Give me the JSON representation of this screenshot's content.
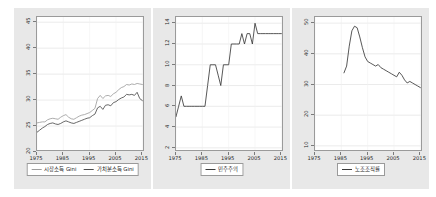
{
  "figure": {
    "background": "#ffffff",
    "panel_background": "#e8e8e8",
    "plot_background": "#ffffff",
    "grid": "on"
  },
  "chart_data": [
    {
      "type": "line",
      "title": "",
      "xlabel": "",
      "ylabel": "",
      "xlim": [
        1975,
        2016
      ],
      "ylim": [
        20,
        46
      ],
      "xticks": [
        1975,
        1985,
        1995,
        2005,
        2015
      ],
      "yticks": [
        20,
        25,
        30,
        35,
        40,
        45
      ],
      "grid": "on",
      "legend_position": "below",
      "series": [
        {
          "name": "시장소득 Gini",
          "color": "#9e9e9e",
          "x": [
            1975,
            1976,
            1977,
            1978,
            1979,
            1980,
            1981,
            1982,
            1983,
            1984,
            1985,
            1986,
            1987,
            1988,
            1989,
            1990,
            1991,
            1992,
            1993,
            1994,
            1995,
            1996,
            1997,
            1998,
            1999,
            2000,
            2001,
            2002,
            2003,
            2004,
            2005,
            2006,
            2007,
            2008,
            2009,
            2010,
            2011,
            2012,
            2013,
            2014,
            2015
          ],
          "values": [
            25.6,
            25.7,
            25.8,
            25.8,
            26.2,
            26.4,
            26.5,
            26.4,
            26.3,
            26.7,
            27.0,
            27.2,
            26.7,
            26.4,
            26.3,
            26.6,
            26.9,
            27.1,
            27.2,
            27.4,
            27.6,
            28.0,
            28.4,
            30.3,
            30.9,
            30.3,
            30.8,
            30.9,
            30.7,
            31.2,
            31.5,
            32.0,
            32.4,
            32.6,
            33.0,
            32.9,
            33.1,
            33.0,
            33.2,
            33.1,
            33.0
          ]
        },
        {
          "name": "가처분소득 Gini",
          "color": "#4d4d4d",
          "x": [
            1975,
            1976,
            1977,
            1978,
            1979,
            1980,
            1981,
            1982,
            1983,
            1984,
            1985,
            1986,
            1987,
            1988,
            1989,
            1990,
            1991,
            1992,
            1993,
            1994,
            1995,
            1996,
            1997,
            1998,
            1999,
            2000,
            2001,
            2002,
            2003,
            2004,
            2005,
            2006,
            2007,
            2008,
            2009,
            2010,
            2011,
            2012,
            2013,
            2014,
            2015
          ],
          "values": [
            23.8,
            24.2,
            24.6,
            24.9,
            25.3,
            25.5,
            25.6,
            25.4,
            25.3,
            25.5,
            25.8,
            26.0,
            25.8,
            25.6,
            25.5,
            25.7,
            25.9,
            26.1,
            26.3,
            26.5,
            26.6,
            27.0,
            27.3,
            28.5,
            28.8,
            28.2,
            29.0,
            29.1,
            28.9,
            29.5,
            29.7,
            30.1,
            30.4,
            30.6,
            31.1,
            31.0,
            31.1,
            30.9,
            31.5,
            30.3,
            29.9
          ]
        }
      ]
    },
    {
      "type": "line",
      "title": "",
      "xlabel": "",
      "ylabel": "",
      "xlim": [
        1975,
        2016
      ],
      "ylim": [
        1.6,
        14.6
      ],
      "xticks": [
        1975,
        1985,
        1995,
        2005,
        2015
      ],
      "yticks": [
        2,
        4,
        6,
        8,
        10,
        12,
        14
      ],
      "grid": "on",
      "legend_position": "below",
      "series": [
        {
          "name": "민주주의",
          "color": "#3a3a3a",
          "x": [
            1975,
            1976,
            1977,
            1978,
            1979,
            1980,
            1981,
            1982,
            1983,
            1984,
            1985,
            1986,
            1987,
            1988,
            1989,
            1990,
            1991,
            1992,
            1993,
            1994,
            1995,
            1996,
            1997,
            1998,
            1999,
            2000,
            2001,
            2002,
            2003,
            2004,
            2005,
            2006,
            2007,
            2008,
            2009,
            2010,
            2011,
            2012,
            2013,
            2014,
            2015
          ],
          "values": [
            5.0,
            6.0,
            7.0,
            6.0,
            6.0,
            6.0,
            6.0,
            6.0,
            6.0,
            6.0,
            6.0,
            6.0,
            8.0,
            10.0,
            10.0,
            10.0,
            9.0,
            8.0,
            10.0,
            10.0,
            10.0,
            12.0,
            12.0,
            12.0,
            12.0,
            13.0,
            12.0,
            13.0,
            13.0,
            12.0,
            14.0,
            13.0,
            13.0,
            13.0,
            13.0,
            13.0,
            13.0,
            13.0,
            13.0,
            13.0,
            13.0
          ]
        }
      ]
    },
    {
      "type": "line",
      "title": "",
      "xlabel": "",
      "ylabel": "",
      "xlim": [
        1975,
        2016
      ],
      "ylim": [
        8,
        52
      ],
      "xticks": [
        1975,
        1985,
        1995,
        2005,
        2015
      ],
      "yticks": [
        10,
        20,
        30,
        40,
        50
      ],
      "grid": "on",
      "legend_position": "below",
      "series": [
        {
          "name": "노조조직률",
          "color": "#3a3a3a",
          "x": [
            1986,
            1987,
            1988,
            1989,
            1990,
            1991,
            1992,
            1993,
            1994,
            1995,
            1996,
            1997,
            1998,
            1999,
            2000,
            2001,
            2002,
            2003,
            2004,
            2005,
            2006,
            2007,
            2008,
            2009,
            2010,
            2011,
            2012,
            2013,
            2014,
            2015
          ],
          "values": [
            33.8,
            36.0,
            42.5,
            47.5,
            49.0,
            48.5,
            45.5,
            42.0,
            39.0,
            37.5,
            37.0,
            36.5,
            36.0,
            36.5,
            35.5,
            35.0,
            34.5,
            34.0,
            33.5,
            33.0,
            32.5,
            34.0,
            33.0,
            31.5,
            30.5,
            31.0,
            30.5,
            30.0,
            29.5,
            29.0
          ]
        }
      ]
    }
  ]
}
